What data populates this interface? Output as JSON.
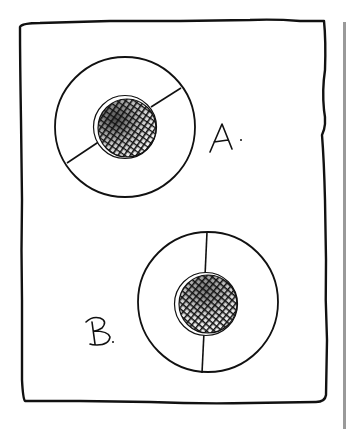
{
  "figure": {
    "colors": {
      "ink": "#111111",
      "paper": "#ffffff",
      "edge_strip": "#9a9a9a"
    },
    "panels": [
      {
        "id": "A",
        "label": "A.",
        "divider_orientation": "diagonal"
      },
      {
        "id": "B",
        "label": "B.",
        "divider_orientation": "vertical"
      }
    ]
  }
}
